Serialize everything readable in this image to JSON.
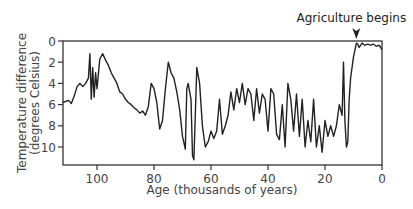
{
  "chart_data": {
    "type": "line",
    "title": "",
    "xlabel": "Age (thousands of years)",
    "ylabel_line1": "Temperature difference",
    "ylabel_line2": "(degrees Celsius)",
    "xlim": [
      112,
      0
    ],
    "ylim": [
      0,
      11.6
    ],
    "x_inverted": true,
    "y_inverted": true,
    "grid": false,
    "x_ticks": [
      100,
      80,
      60,
      40,
      20,
      0
    ],
    "x_tick_labels": [
      "100",
      "80",
      "60",
      "40",
      "20",
      "0"
    ],
    "y_ticks": [
      0,
      2,
      4,
      6,
      8,
      10
    ],
    "y_tick_labels": [
      "0",
      "2",
      "4",
      "6",
      "8",
      "10"
    ],
    "annotation": {
      "text": "Agriculture begins",
      "x": 9,
      "y": 0,
      "marker": "downward-arrowhead"
    },
    "series": [
      {
        "name": "Temperature difference",
        "color": "#222222",
        "x": [
          112,
          110,
          109,
          108,
          107,
          106,
          105,
          104,
          103,
          102.5,
          102,
          101.5,
          101,
          100.5,
          100,
          99,
          98,
          97,
          96,
          95,
          94,
          93,
          92,
          91,
          90,
          89,
          88,
          87,
          86,
          85,
          84,
          83,
          82,
          81,
          80,
          79,
          78,
          77,
          76,
          75,
          74,
          73,
          72,
          71,
          70,
          69,
          68.5,
          68,
          67,
          66.5,
          66,
          65,
          64,
          63,
          62,
          61,
          60,
          59,
          58,
          57,
          56,
          55,
          54,
          53,
          52,
          51,
          50,
          49,
          48,
          47,
          46,
          45,
          44,
          43,
          42,
          41,
          40,
          39,
          38,
          37,
          36,
          35,
          34,
          33,
          32,
          31,
          30,
          29,
          28,
          27,
          26,
          25,
          24,
          23,
          22,
          21,
          20,
          19,
          18,
          17,
          16,
          15,
          14,
          13.5,
          13,
          12.5,
          12,
          11.5,
          11,
          10,
          9,
          8.5,
          8,
          7,
          6,
          5,
          4,
          3,
          2,
          1,
          0
        ],
        "values": [
          5.8,
          5.6,
          5.9,
          5.2,
          4.3,
          4.0,
          4.3,
          4.0,
          3.5,
          1.2,
          5.5,
          2.5,
          5.3,
          3.0,
          4.5,
          1.7,
          1.2,
          1.8,
          2.3,
          3.0,
          3.5,
          4.0,
          4.8,
          5.0,
          5.5,
          5.8,
          6.0,
          6.3,
          6.5,
          6.8,
          6.6,
          7.0,
          6.2,
          4.0,
          4.5,
          5.8,
          8.3,
          7.5,
          4.5,
          2.0,
          3.0,
          3.5,
          4.8,
          6.5,
          9.0,
          10.2,
          4.5,
          4.0,
          5.5,
          10.8,
          11.2,
          2.5,
          4.0,
          8.0,
          10.0,
          9.5,
          8.5,
          9.2,
          8.5,
          5.5,
          8.8,
          8.0,
          7.0,
          4.8,
          6.5,
          4.5,
          5.8,
          4.0,
          6.0,
          4.5,
          5.0,
          7.5,
          4.5,
          6.8,
          5.0,
          5.5,
          8.5,
          4.5,
          5.0,
          8.8,
          9.3,
          6.0,
          10.0,
          4.0,
          5.5,
          8.5,
          5.0,
          9.0,
          5.5,
          10.0,
          7.5,
          9.5,
          5.5,
          10.0,
          8.0,
          10.5,
          7.5,
          9.0,
          8.0,
          9.0,
          8.0,
          6.0,
          7.0,
          2.0,
          7.5,
          10.0,
          9.5,
          5.5,
          3.5,
          1.5,
          0.2,
          0.3,
          0.6,
          0.2,
          0.4,
          0.3,
          0.4,
          0.3,
          0.5,
          0.4,
          0.8
        ]
      }
    ]
  },
  "layout": {
    "plot_left": 63,
    "plot_right": 382,
    "plot_top": 41,
    "plot_bottom": 165,
    "px_per_kyr": 2.85,
    "px_per_degree": 10.6
  }
}
